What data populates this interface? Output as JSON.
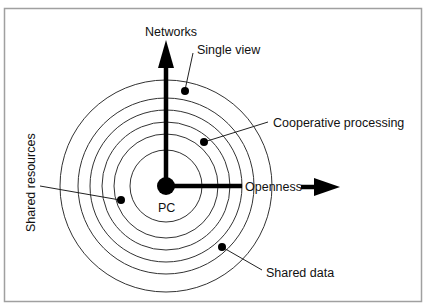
{
  "diagram": {
    "frame": {
      "x": 4,
      "y": 8,
      "width": 418,
      "height": 294,
      "stroke": "#9a9a9a"
    },
    "center": {
      "x": 166,
      "y": 186,
      "label": "PC",
      "dot_radius": 9
    },
    "rings": [
      36,
      52,
      64,
      76,
      88,
      106
    ],
    "axes": {
      "vertical": {
        "label": "Networks",
        "color": "#000000"
      },
      "horizontal": {
        "label": "Openness",
        "color": "#000000"
      }
    },
    "callouts": [
      {
        "id": "single-view",
        "label": "Single view"
      },
      {
        "id": "cooperative-processing",
        "label": "Cooperative processing"
      },
      {
        "id": "shared-resources",
        "label": "Shared resources"
      },
      {
        "id": "shared-data",
        "label": "Shared data"
      }
    ],
    "colors": {
      "ink": "#111111",
      "ring": "#333333",
      "background": "#ffffff"
    }
  }
}
